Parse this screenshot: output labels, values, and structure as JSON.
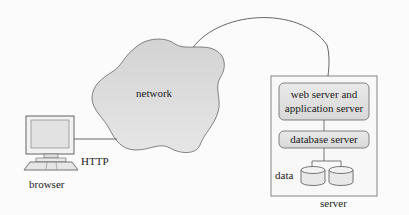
{
  "diagram": {
    "title": "",
    "nodes": {
      "network": {
        "label": "network"
      },
      "browser": {
        "label": "browser"
      },
      "server": {
        "label": "server"
      },
      "web_app_server": {
        "label_line1": "web server and",
        "label_line2": "application server"
      },
      "database_server": {
        "label": "database server"
      },
      "data": {
        "label": "data"
      }
    },
    "edges": {
      "browser_network": {
        "label": "HTTP"
      },
      "network_server": {
        "label": ""
      }
    },
    "colors": {
      "cloud_fill": "#dcdcdc",
      "box_fill": "#e4e4e4",
      "stroke": "#555555",
      "background": "#fbfbfb"
    }
  }
}
